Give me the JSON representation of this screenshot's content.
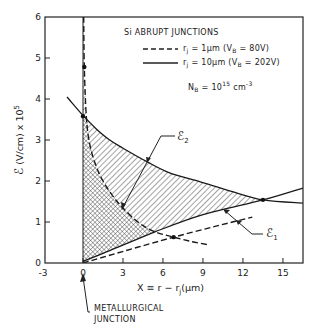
{
  "chart_data": {
    "type": "line",
    "title": "Si ABRUPT JUNCTIONS",
    "xlabel": "X ≡ r − rⱼ (μm)",
    "ylabel": "ℰ (V/cm) × 10⁵",
    "xlim": [
      -3,
      16.5
    ],
    "ylim": [
      0,
      6
    ],
    "xticks": [
      -3,
      0,
      3,
      6,
      9,
      12,
      15
    ],
    "yticks": [
      0,
      1,
      2,
      3,
      4,
      5,
      6
    ],
    "grid": false,
    "legend_position": "upper right (inside)",
    "legend": [
      {
        "style": "dashed",
        "label": "rⱼ = 1μm (Vʙ = 80V)"
      },
      {
        "style": "solid",
        "label": "rⱼ = 10μm (Vʙ = 202V)"
      }
    ],
    "annotation_doping": "N_B = 10^15 cm^-3",
    "series": [
      {
        "name": "E2, rj=10um (solid)",
        "style": "solid",
        "x": [
          -1.2,
          0,
          1,
          2,
          3,
          4.8,
          6.5,
          8.8,
          11,
          13.5,
          16.5
        ],
        "y": [
          4.05,
          3.6,
          3.27,
          3.0,
          2.8,
          2.47,
          2.2,
          1.98,
          1.76,
          1.54,
          1.46
        ]
      },
      {
        "name": "E1, rj=10um (solid)",
        "style": "solid",
        "x": [
          0,
          2,
          5.4,
          9,
          13.5,
          16.5
        ],
        "y": [
          0.04,
          0.3,
          0.76,
          1.18,
          1.54,
          1.83
        ]
      },
      {
        "name": "E2, rj=1um (dashed)",
        "style": "dashed",
        "x": [
          0.05,
          0.1,
          0.25,
          0.5,
          1.0,
          1.5,
          2.2,
          3.0,
          4.2,
          5.4,
          6.8,
          8.2,
          9.5
        ],
        "y": [
          6.0,
          4.78,
          3.58,
          2.9,
          2.35,
          2.0,
          1.65,
          1.34,
          0.98,
          0.76,
          0.63,
          0.52,
          0.44
        ]
      },
      {
        "name": "E1, rj=1um (dashed)",
        "style": "dashed",
        "x": [
          0,
          6.8,
          12.7
        ],
        "y": [
          0.0,
          0.63,
          1.12
        ]
      }
    ],
    "markers": [
      {
        "x": 0.1,
        "y": 4.78
      },
      {
        "x": 0.0,
        "y": 3.58
      },
      {
        "x": 6.8,
        "y": 0.63
      },
      {
        "x": 13.5,
        "y": 1.54
      }
    ],
    "labels": {
      "e2": "ℰ₂",
      "e1": "ℰ₁",
      "junction_line1": "METALLURGICAL",
      "junction_line2": "JUNCTION"
    }
  },
  "figure": {
    "title": "Si ABRUPT JUNCTIONS",
    "legend_dashed": "r",
    "legend_dashed_sub": "j",
    "legend_dashed_rest": " = 1μm (V",
    "legend_dashed_vsub": "B",
    "legend_dashed_end": " = 80V)",
    "legend_solid": "r",
    "legend_solid_sub": "j",
    "legend_solid_rest": " = 10μm (V",
    "legend_solid_vsub": "B",
    "legend_solid_end": " = 202V)",
    "doping_n": "N",
    "doping_sub": "B",
    "doping_eq": " = 10",
    "doping_exp": "15",
    "doping_unit": " cm",
    "doping_unit_exp": "-3",
    "ylabel_symbol": "ℰ",
    "ylabel_rest": " (V/cm) x 10",
    "ylabel_exp": "5",
    "xlabel_main": "X ≡ r − r",
    "xlabel_sub": "j",
    "xlabel_end": "(μm)",
    "e2_label": "ℰ",
    "e2_sub": "2",
    "e1_label": "ℰ",
    "e1_sub": "1",
    "junction_line1": "METALLURGICAL",
    "junction_line2": "JUNCTION"
  }
}
